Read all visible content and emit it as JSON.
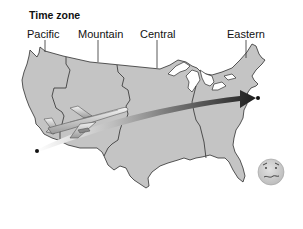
{
  "title": "Time zone",
  "zones": [
    {
      "label": "Pacific"
    },
    {
      "label": "Mountain"
    },
    {
      "label": "Central"
    },
    {
      "label": "Eastern"
    }
  ],
  "illustration": {
    "map": "contiguous-united-states",
    "map_fill": "#c4c4c4",
    "border_color": "#333333",
    "flight": {
      "origin": "west-coast (Los Angeles area)",
      "destination": "east-coast (New York area)",
      "arrow_gradient_start": "#ffffff",
      "arrow_gradient_end": "#222222"
    },
    "airplane": "airliner-icon",
    "face": "queasy-face-icon",
    "face_fill": "#cfcfcf"
  }
}
